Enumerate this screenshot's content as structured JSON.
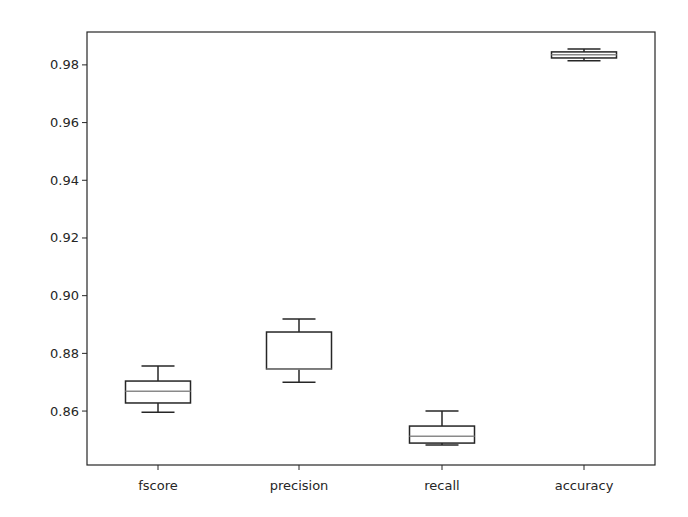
{
  "chart_data": {
    "type": "box",
    "title": "",
    "xlabel": "",
    "ylabel": "",
    "categories": [
      "fscore",
      "precision",
      "recall",
      "accuracy"
    ],
    "ylim": [
      0.8413,
      0.9914
    ],
    "yticks": [
      0.86,
      0.88,
      0.9,
      0.92,
      0.94,
      0.96,
      0.98
    ],
    "ytick_labels": [
      "0.86",
      "0.88",
      "0.90",
      "0.92",
      "0.94",
      "0.96",
      "0.98"
    ],
    "grid": false,
    "legend": null,
    "boxes": [
      {
        "name": "fscore",
        "whisker_low": 0.8596,
        "q1": 0.8628,
        "median": 0.8669,
        "q3": 0.8704,
        "whisker_high": 0.8756
      },
      {
        "name": "precision",
        "whisker_low": 0.87,
        "q1": 0.8746,
        "median": 0.8746,
        "q3": 0.8874,
        "whisker_high": 0.8919
      },
      {
        "name": "recall",
        "whisker_low": 0.8482,
        "q1": 0.8489,
        "median": 0.8513,
        "q3": 0.8548,
        "whisker_high": 0.86
      },
      {
        "name": "accuracy",
        "whisker_low": 0.9814,
        "q1": 0.9824,
        "median": 0.9835,
        "q3": 0.9845,
        "whisker_high": 0.9855
      }
    ]
  },
  "colors": {
    "axis": "#262626",
    "box": "#262626",
    "median": "#8a8a8a",
    "background": "#ffffff"
  }
}
